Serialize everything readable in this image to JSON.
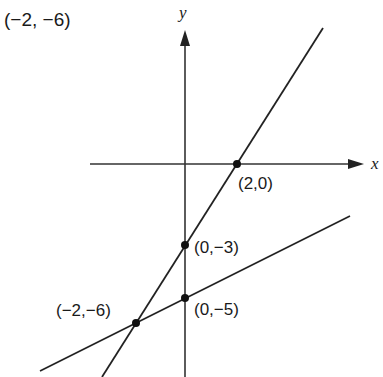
{
  "title": "(−2, −6)",
  "axes": {
    "x_label": "x",
    "y_label": "y"
  },
  "lines": [
    {
      "name": "steep-line",
      "points": [
        "(-2,-6)",
        "(0,-3)",
        "(2,0)"
      ]
    },
    {
      "name": "shallow-line",
      "points": [
        "(-2,-6)",
        "(0,-5)"
      ]
    }
  ],
  "points": [
    {
      "label": "(2,0)"
    },
    {
      "label": "(0,−3)"
    },
    {
      "label": "(0,−5)"
    },
    {
      "label": "(−2,−6)"
    }
  ]
}
